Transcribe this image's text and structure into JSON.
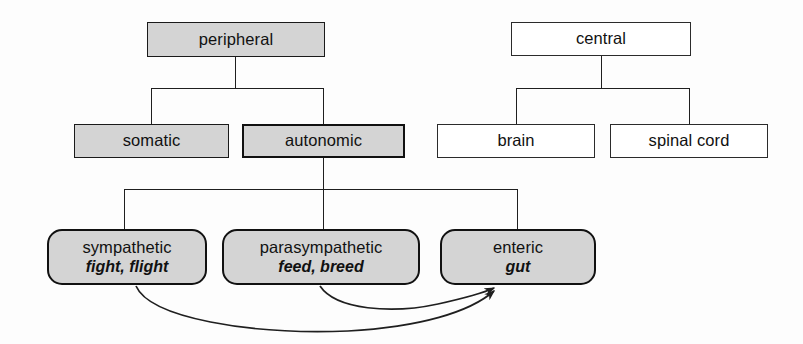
{
  "diagram": {
    "colors": {
      "shaded_fill": "#d4d4d4",
      "plain_fill": "#ffffff",
      "stroke": "#111111",
      "background": "#fdfdfd"
    },
    "nodes": {
      "peripheral": {
        "label": "peripheral"
      },
      "somatic": {
        "label": "somatic"
      },
      "autonomic": {
        "label": "autonomic"
      },
      "sympathetic": {
        "label": "sympathetic",
        "sublabel": "fight, flight"
      },
      "parasympathetic": {
        "label": "parasympathetic",
        "sublabel": "feed, breed"
      },
      "enteric": {
        "label": "enteric",
        "sublabel": "gut"
      },
      "central": {
        "label": "central"
      },
      "brain": {
        "label": "brain"
      },
      "spinal_cord": {
        "label": "spinal cord"
      }
    }
  }
}
